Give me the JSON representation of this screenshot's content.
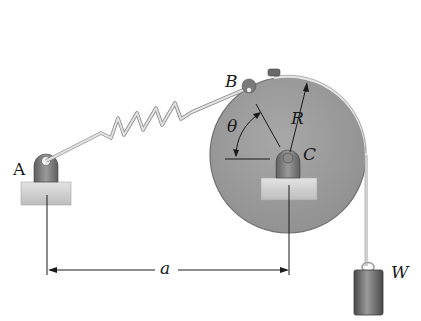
{
  "diagram": {
    "labels": {
      "pin_A": "A",
      "point_B": "B",
      "center_C": "C",
      "radius": "R",
      "angle": "θ",
      "weight": "W",
      "distance": "a"
    },
    "colors": {
      "disk": "#9a9a9a",
      "disk_edge": "#6f6f6f",
      "support_base": "#cfcfcf",
      "bracket": "#7d7d7d",
      "spring": "#d8d8d8",
      "weight": "#6a6a6a",
      "line": "#1a1a1a"
    }
  }
}
